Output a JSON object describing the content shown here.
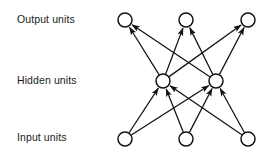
{
  "figure": {
    "width": 273,
    "height": 158,
    "background_color": "#ffffff",
    "stroke_color": "#111111",
    "text_color": "#1a1a1a"
  },
  "labels": {
    "output": "Output units",
    "hidden": "Hidden units",
    "input": "Input units"
  },
  "diagram_data": {
    "type": "node-link-diagram",
    "directed": true,
    "flow_direction": "bottom-to-top",
    "node_radius": 7,
    "layers": [
      {
        "id": "output",
        "label": "Output units",
        "y": 20,
        "nodes": [
          {
            "id": "o1",
            "x": 125,
            "y": 20
          },
          {
            "id": "o2",
            "x": 186,
            "y": 20
          },
          {
            "id": "o3",
            "x": 248,
            "y": 20
          }
        ]
      },
      {
        "id": "hidden",
        "label": "Hidden units",
        "y": 81,
        "nodes": [
          {
            "id": "h1",
            "x": 163,
            "y": 81
          },
          {
            "id": "h2",
            "x": 216,
            "y": 81
          }
        ]
      },
      {
        "id": "input",
        "label": "Input units",
        "y": 139,
        "nodes": [
          {
            "id": "i1",
            "x": 125,
            "y": 139
          },
          {
            "id": "i2",
            "x": 186,
            "y": 139
          },
          {
            "id": "i3",
            "x": 248,
            "y": 139
          }
        ]
      }
    ],
    "edges": [
      {
        "from": "i1",
        "to": "h1"
      },
      {
        "from": "i1",
        "to": "h2"
      },
      {
        "from": "i2",
        "to": "h1"
      },
      {
        "from": "i2",
        "to": "h2"
      },
      {
        "from": "i3",
        "to": "h1"
      },
      {
        "from": "i3",
        "to": "h2"
      },
      {
        "from": "h1",
        "to": "o1"
      },
      {
        "from": "h1",
        "to": "o2"
      },
      {
        "from": "h1",
        "to": "o3"
      },
      {
        "from": "h2",
        "to": "o1"
      },
      {
        "from": "h2",
        "to": "o2"
      },
      {
        "from": "h2",
        "to": "o3"
      }
    ]
  }
}
